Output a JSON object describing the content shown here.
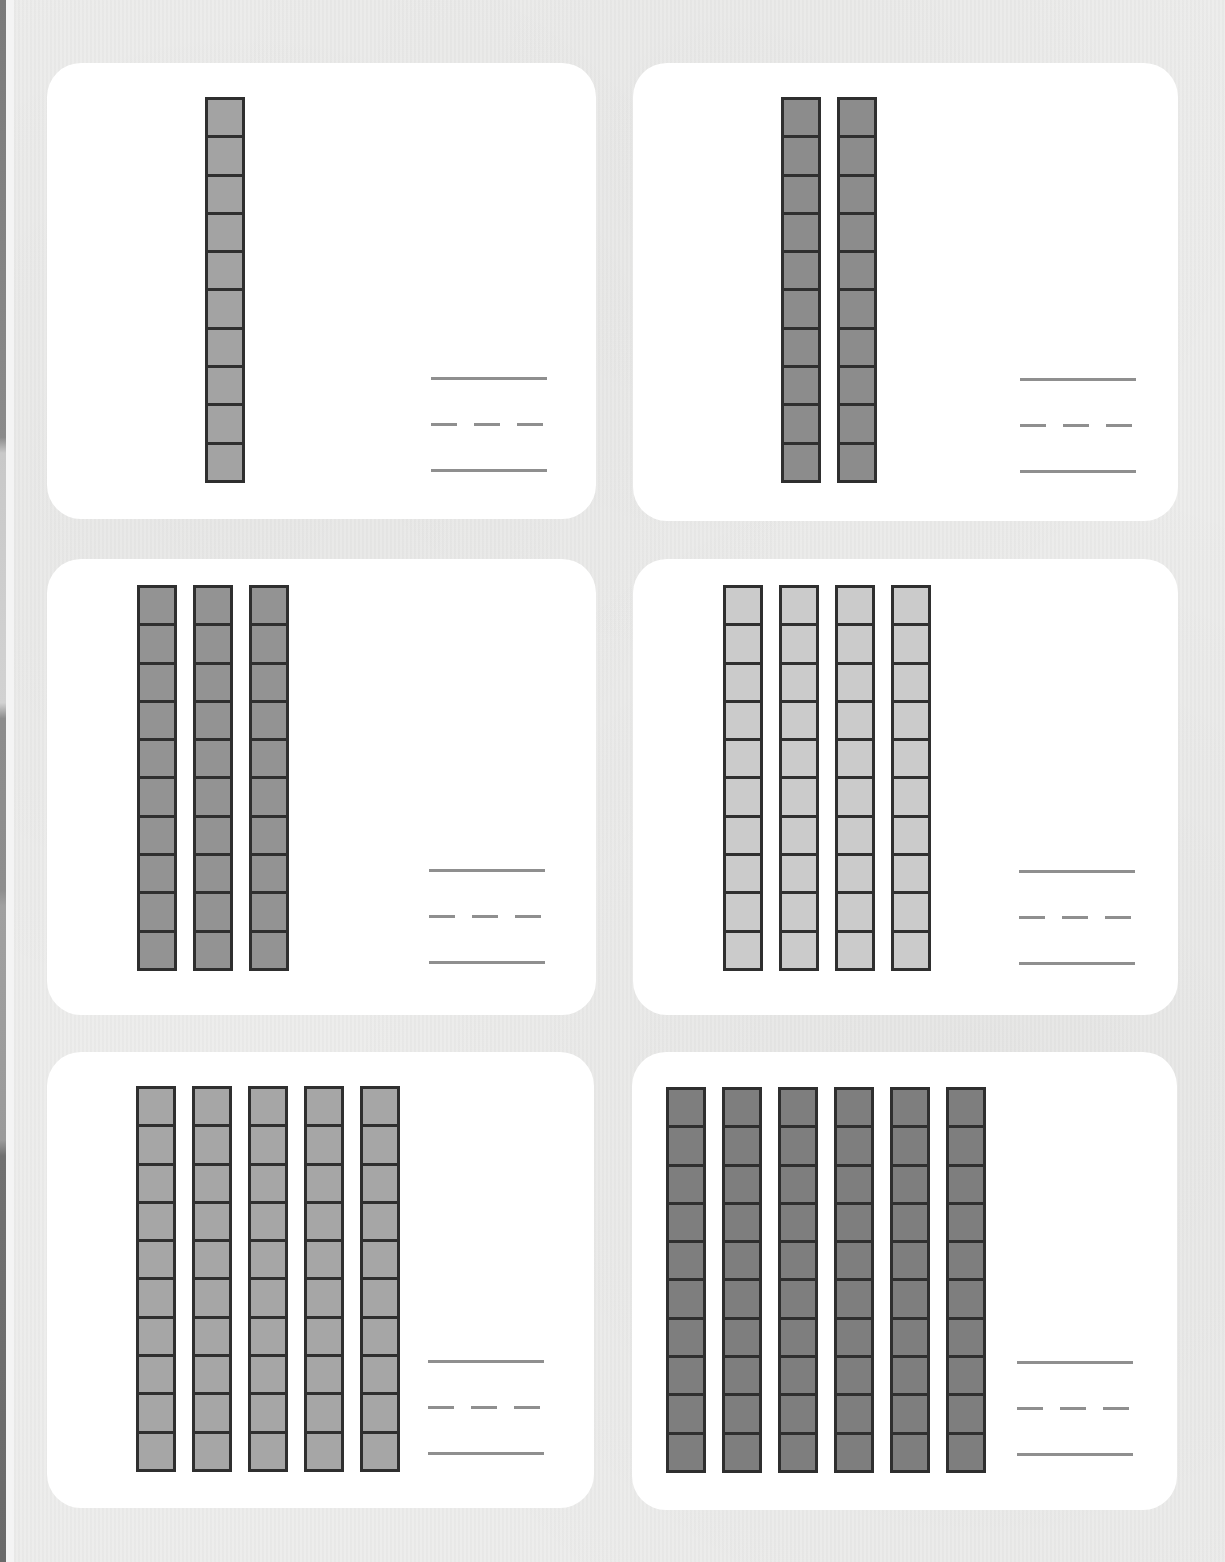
{
  "page": {
    "type": "base-ten rods counting worksheet",
    "background_color": "#ececeb",
    "card_color": "#ffffff",
    "rod_border_color": "#2f2f2f",
    "answer_line_color": "#8f8f8f",
    "cells_per_rod": 10
  },
  "cards": [
    {
      "id": 1,
      "rod_count": 1,
      "rod_fill": "#a3a3a3",
      "answer_lines": [
        "solid",
        "dashed",
        "solid"
      ]
    },
    {
      "id": 2,
      "rod_count": 2,
      "rod_fill": "#8c8c8c",
      "answer_lines": [
        "solid",
        "dashed",
        "solid"
      ]
    },
    {
      "id": 3,
      "rod_count": 3,
      "rod_fill": "#939393",
      "answer_lines": [
        "solid",
        "dashed",
        "solid"
      ]
    },
    {
      "id": 4,
      "rod_count": 4,
      "rod_fill": "#cbcbcb",
      "answer_lines": [
        "solid",
        "dashed",
        "solid"
      ]
    },
    {
      "id": 5,
      "rod_count": 5,
      "rod_fill": "#a6a6a6",
      "answer_lines": [
        "solid",
        "dashed",
        "solid"
      ]
    },
    {
      "id": 6,
      "rod_count": 6,
      "rod_fill": "#7e7e7e",
      "answer_lines": [
        "solid",
        "dashed",
        "solid"
      ]
    }
  ]
}
